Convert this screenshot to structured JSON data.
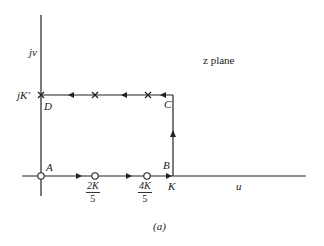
{
  "diagram": {
    "plane_label": "z plane",
    "axes": {
      "vertical": "jv",
      "horizontal": "u"
    },
    "vertical_tick_label": "jK'",
    "points": [
      {
        "name": "A",
        "label": "A"
      },
      {
        "name": "B",
        "label": "B"
      },
      {
        "name": "C",
        "label": "C"
      },
      {
        "name": "D",
        "label": "D"
      }
    ],
    "horizontal_ticks": [
      {
        "num": "2K",
        "den": "5"
      },
      {
        "num": "4K",
        "den": "5"
      },
      {
        "label": "K"
      }
    ],
    "caption": "(a)",
    "markers": {
      "zeros_on_real_axis": [
        "A",
        "2K/5",
        "4K/5"
      ],
      "poles_on_top_edge": [
        "D",
        "2K/5 + jK'",
        "4K/5 + jK'"
      ]
    },
    "path": "A → B → C → D (rectangle traversed counterclockwise)"
  }
}
